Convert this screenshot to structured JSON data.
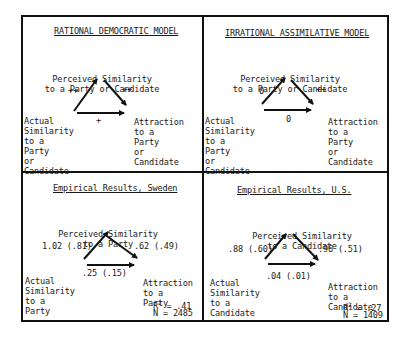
{
  "panels": {
    "rational": {
      "title": "RATIONAL DEMOCRATIC MODEL",
      "top_node": [
        "Perceived Similarity",
        "to a Party or Candidate"
      ],
      "left_node": [
        "Actual",
        "Similarity",
        "to a",
        "Party",
        "or",
        "Candidate"
      ],
      "right_node": [
        "Attraction",
        "to a",
        "Party",
        "or",
        "Candidate"
      ],
      "paths": {
        "actual_to_perceived": "++",
        "perceived_to_attraction": "++",
        "actual_to_attraction": "+"
      }
    },
    "irrational": {
      "title": "IRRATIONAL ASSIMILATIVE MODEL",
      "top_node": [
        "Perceived Similarity",
        "to a Party or Candidate"
      ],
      "left_node": [
        "Actual",
        "Similarity",
        "to a",
        "Party",
        "or",
        "Candidate"
      ],
      "right_node": [
        "Attraction",
        "to a",
        "Party",
        "or",
        "Candidate"
      ],
      "paths": {
        "actual_to_perceived": "0",
        "perceived_to_attraction": "++",
        "actual_to_attraction": "0"
      }
    },
    "sweden": {
      "title": "Empirical Results, Sweden",
      "top_node": [
        "Perceived Similarity",
        "to a Party"
      ],
      "left_node": [
        "Actual",
        "Similarity",
        "to a",
        "Party"
      ],
      "right_node": [
        "Attraction",
        "to a",
        "Party"
      ],
      "paths": {
        "actual_to_perceived": "1.02 (.81)",
        "perceived_to_attraction": ".62 (.49)",
        "actual_to_attraction": ".25 (.15)"
      },
      "r2_label": "R",
      "r2_sup": "2",
      "r2_value": " = .41",
      "n": "N = 2485"
    },
    "us": {
      "title": "Empirical Results, U.S.",
      "top_node": [
        "Perceived Similarity",
        "to a Candidate"
      ],
      "left_node": [
        "Actual",
        "Similarity",
        "to a",
        "Candidate"
      ],
      "right_node": [
        "Attraction",
        "to a",
        "Candidate"
      ],
      "paths": {
        "actual_to_perceived": ".88 (.60)",
        "perceived_to_attraction": ".96 (.51)",
        "actual_to_attraction": ".04 (.01)"
      },
      "r2_label": "R",
      "r2_sup": "2",
      "r2_value": " = .27",
      "n": "N = 1409"
    }
  }
}
